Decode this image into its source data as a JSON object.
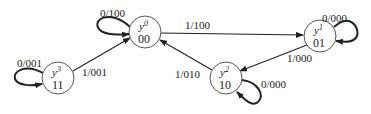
{
  "diagram": {
    "type": "state-transition-diagram",
    "states": [
      {
        "id": "y0",
        "name": "y",
        "sup": "0",
        "code": "00"
      },
      {
        "id": "y1",
        "name": "y",
        "sup": "1",
        "code": "01"
      },
      {
        "id": "y2",
        "name": "y",
        "sup": "2",
        "code": "10"
      },
      {
        "id": "y3",
        "name": "y",
        "sup": "3",
        "code": "11"
      }
    ],
    "transitions": [
      {
        "from": "y0",
        "to": "y0",
        "label": "0/100"
      },
      {
        "from": "y0",
        "to": "y1",
        "label": "1/100"
      },
      {
        "from": "y1",
        "to": "y1",
        "label": "0/000"
      },
      {
        "from": "y1",
        "to": "y2",
        "label": "1/000"
      },
      {
        "from": "y2",
        "to": "y2",
        "label": "0/000"
      },
      {
        "from": "y2",
        "to": "y0",
        "label": "1/010"
      },
      {
        "from": "y3",
        "to": "y3",
        "label": "0/001"
      },
      {
        "from": "y3",
        "to": "y0",
        "label": "1/001"
      }
    ]
  }
}
